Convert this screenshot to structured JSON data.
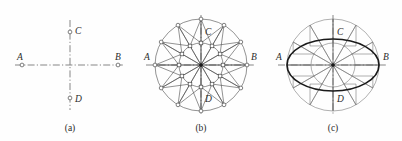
{
  "figure": {
    "background_color": "#fefefe",
    "line_color": "#4a4a4a",
    "heavy_line_color": "#1a1a1a",
    "centerline_color": "#555555",
    "label_color": "#2b2b2b"
  },
  "panels": [
    {
      "id": "a",
      "caption": "(a)",
      "center": {
        "x": 70,
        "y": 65
      },
      "description": "Two perpendicular dash-dot center lines with four endpoint markers",
      "axis_labels": {
        "left": "A",
        "right": "B",
        "top": "C",
        "bottom": "D"
      },
      "semi_major": 48,
      "semi_minor": 33,
      "horizontal_extent": 55,
      "vertical_extent": 45,
      "markers": [
        {
          "name": "A",
          "x": 22,
          "y": 65
        },
        {
          "name": "B",
          "x": 118,
          "y": 65
        },
        {
          "name": "C",
          "x": 70,
          "y": 32
        },
        {
          "name": "D",
          "x": 70,
          "y": 98
        }
      ]
    },
    {
      "id": "b",
      "caption": "(b)",
      "center": {
        "x": 201,
        "y": 65
      },
      "description": "Circle divided into twelve equal sectors with inner concentric circle, square nodes on inner ring, round nodes on outer ring, joined by chords",
      "axis_labels": {
        "left": "A",
        "right": "B",
        "top": "C",
        "bottom": "D"
      },
      "outer_radius": 46,
      "inner_radius": 22,
      "spoke_count": 12,
      "spoke_angles_deg": [
        0,
        30,
        60,
        90,
        120,
        150,
        180,
        210,
        240,
        270,
        300,
        330
      ],
      "horizontal_extent": 55,
      "vertical_extent": 50
    },
    {
      "id": "c",
      "caption": "(c)",
      "center": {
        "x": 333,
        "y": 65
      },
      "description": "Same twelve-sector circle with a heavy ellipse inscribed, major axis A-B and minor axis C-D, with projection rectangles linking circle points to ellipse points",
      "axis_labels": {
        "left": "A",
        "right": "B",
        "top": "C",
        "bottom": "D"
      },
      "outer_radius": 46,
      "inner_radius": 22,
      "ellipse_semi_major": 46,
      "ellipse_semi_minor": 26,
      "spoke_count": 12,
      "spoke_angles_deg": [
        0,
        30,
        60,
        90,
        120,
        150,
        180,
        210,
        240,
        270,
        300,
        330
      ],
      "horizontal_extent": 55,
      "vertical_extent": 50
    }
  ]
}
